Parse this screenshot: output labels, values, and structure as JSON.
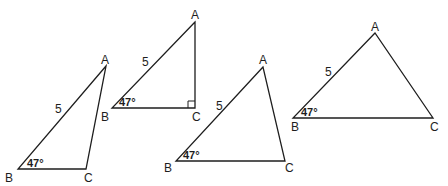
{
  "figure": {
    "colors": {
      "ink": "#1e1e1e",
      "background": "#ffffff"
    },
    "triangles": [
      {
        "id": "triangle-1",
        "vertices": {
          "A": [
            106,
            66
          ],
          "B": [
            18,
            169
          ],
          "C": [
            86,
            169
          ]
        },
        "labels": {
          "A": "A",
          "B": "B",
          "C": "C"
        },
        "side_label": "5",
        "angle_label": "47°",
        "right_angle_at_C": false
      },
      {
        "id": "triangle-2",
        "vertices": {
          "A": [
            195,
            22
          ],
          "B": [
            112,
            108
          ],
          "C": [
            195,
            108
          ]
        },
        "labels": {
          "A": "A",
          "B": "B",
          "C": "C"
        },
        "side_label": "5",
        "angle_label": "47°",
        "right_angle_at_C": true
      },
      {
        "id": "triangle-3",
        "vertices": {
          "A": [
            263,
            67
          ],
          "B": [
            176,
            161
          ],
          "C": [
            285,
            161
          ]
        },
        "labels": {
          "A": "A",
          "B": "B",
          "C": "C"
        },
        "side_label": "5",
        "angle_label": "47°",
        "right_angle_at_C": false
      },
      {
        "id": "triangle-4",
        "vertices": {
          "A": [
            375,
            33
          ],
          "B": [
            293,
            118
          ],
          "C": [
            433,
            118
          ]
        },
        "labels": {
          "A": "A",
          "B": "B",
          "C": "C"
        },
        "side_label": "5",
        "angle_label": "47°",
        "right_angle_at_C": false
      }
    ]
  }
}
